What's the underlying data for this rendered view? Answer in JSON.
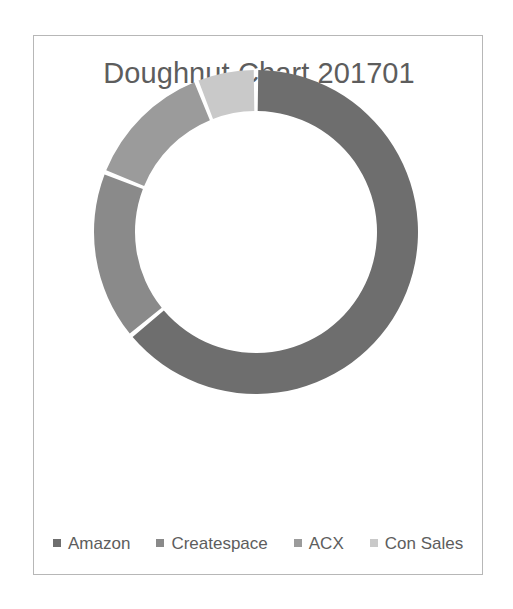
{
  "chart_data": {
    "type": "pie",
    "variant": "doughnut",
    "title": "Doughnut Chart 201701",
    "xlabel": "",
    "ylabel": "",
    "legend_position": "bottom",
    "grid": false,
    "start_angle_deg": 0,
    "direction": "clockwise",
    "hole_ratio": 0.75,
    "categories": [
      "Amazon",
      "Createspace",
      "ACX",
      "Con Sales"
    ],
    "values": [
      64,
      17,
      13,
      6
    ],
    "percentages": [
      "64%",
      "17%",
      "13%",
      "6%"
    ],
    "colors": [
      "#6E6E6E",
      "#8A8A8A",
      "#9B9B9B",
      "#C9C9C9"
    ],
    "slices": [
      {
        "label": "Amazon",
        "value": 64,
        "color": "#6E6E6E",
        "start_deg": 0,
        "end_deg": 230.4
      },
      {
        "label": "Createspace",
        "value": 17,
        "color": "#8A8A8A",
        "start_deg": 230.4,
        "end_deg": 291.6
      },
      {
        "label": "ACX",
        "value": 13,
        "color": "#9B9B9B",
        "start_deg": 291.6,
        "end_deg": 338.4
      },
      {
        "label": "Con Sales",
        "value": 6,
        "color": "#C9C9C9",
        "start_deg": 338.4,
        "end_deg": 360
      }
    ]
  },
  "chart": {
    "title": "Doughnut Chart 201701",
    "border_color": "#b7b7b7",
    "title_color": "#5d5d5d",
    "background": "#ffffff",
    "separator_color": "#ffffff"
  },
  "legend": {
    "items": [
      {
        "label": "Amazon",
        "color": "#6E6E6E",
        "marker": "square-marker"
      },
      {
        "label": "Createspace",
        "color": "#8A8A8A",
        "marker": "square-marker"
      },
      {
        "label": "ACX",
        "color": "#9B9B9B",
        "marker": "square-marker"
      },
      {
        "label": "Con Sales",
        "color": "#C9C9C9",
        "marker": "square-marker"
      }
    ]
  }
}
